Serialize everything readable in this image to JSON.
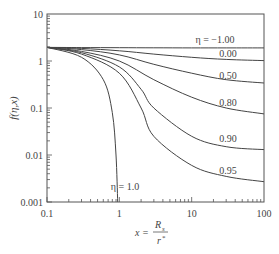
{
  "chart_data": {
    "type": "line",
    "title": "",
    "xlabel": "x = R_s / r*",
    "ylabel": "f(η,x)",
    "xscale": "log",
    "yscale": "log",
    "xlim": [
      0.1,
      100
    ],
    "ylim": [
      0.001,
      10
    ],
    "x_ticks": [
      "0.1",
      "1",
      "10",
      "100"
    ],
    "y_ticks": [
      "0.001",
      "0.01",
      "0.1",
      "1",
      "10"
    ],
    "grid": false,
    "legend": "inline labels at right",
    "series": [
      {
        "name": "η = -1.00",
        "label": "η = −1.00",
        "x": [
          0.1,
          0.3,
          1,
          3,
          10,
          30,
          100
        ],
        "values": [
          1.95,
          1.93,
          1.92,
          1.91,
          1.9,
          1.9,
          1.9
        ]
      },
      {
        "name": "η = 0.00",
        "label": "0.00",
        "x": [
          0.1,
          0.3,
          1,
          3,
          10,
          30,
          100
        ],
        "values": [
          1.95,
          1.85,
          1.65,
          1.4,
          1.2,
          1.08,
          1.02
        ]
      },
      {
        "name": "η = 0.50",
        "label": "0.50",
        "x": [
          0.1,
          0.3,
          1,
          3,
          10,
          30,
          100
        ],
        "values": [
          1.95,
          1.75,
          1.35,
          0.85,
          0.55,
          0.4,
          0.34
        ]
      },
      {
        "name": "η = 0.80",
        "label": "0.80",
        "x": [
          0.1,
          0.3,
          1,
          3,
          10,
          30,
          100
        ],
        "values": [
          1.95,
          1.6,
          1.0,
          0.4,
          0.17,
          0.1,
          0.075
        ]
      },
      {
        "name": "η = 0.90",
        "label": "0.90",
        "x": [
          0.1,
          0.3,
          1,
          2,
          3,
          10,
          30,
          100
        ],
        "values": [
          1.95,
          1.5,
          0.75,
          0.25,
          0.1,
          0.025,
          0.015,
          0.013
        ]
      },
      {
        "name": "η = 0.95",
        "label": "0.95",
        "x": [
          0.1,
          0.3,
          1,
          2,
          3,
          10,
          30,
          100
        ],
        "values": [
          1.95,
          1.4,
          0.55,
          0.1,
          0.025,
          0.006,
          0.0035,
          0.0027
        ]
      },
      {
        "name": "η = 1.0",
        "label": "η = 1.0",
        "x": [
          0.1,
          0.3,
          0.6,
          0.8,
          0.9,
          0.95
        ],
        "values": [
          1.95,
          1.2,
          0.4,
          0.08,
          0.01,
          0.001
        ]
      }
    ]
  },
  "labels": {
    "y_axis": "f(η,x)",
    "x_axis_prefix": "x =",
    "x_axis_num": "R",
    "x_axis_num_sub": "s",
    "x_axis_den": "r",
    "x_axis_den_sup": "*",
    "series_labels": [
      "η = −1.00",
      "0.00",
      "0.50",
      "0.80",
      "0.90",
      "0.95",
      "η = 1.0"
    ]
  },
  "colors": {
    "line": "#444444",
    "axis": "#555555",
    "text": "#444444"
  }
}
